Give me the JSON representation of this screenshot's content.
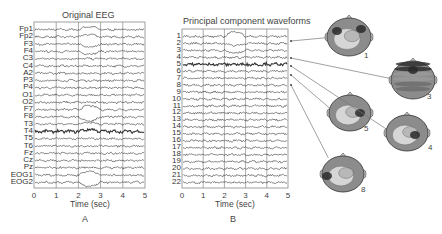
{
  "panel_a": {
    "title": "Original EEG",
    "channels": [
      "Fp1",
      "Fp2",
      "F3",
      "F4",
      "C3",
      "C4",
      "A2",
      "P3",
      "P4",
      "O1",
      "O2",
      "F7",
      "F8",
      "T3",
      "T4",
      "T5",
      "T6",
      "Fz",
      "Cz",
      "Pz",
      "EOG1",
      "EOG2"
    ],
    "xticks": [
      "0",
      "1",
      "2",
      "3",
      "4",
      "5"
    ],
    "xlabel": "Time (sec)",
    "label": "A"
  },
  "panel_b": {
    "title": "Principal component waveforms",
    "components": [
      "1",
      "2",
      "3",
      "4",
      "5",
      "6",
      "7",
      "8",
      "9",
      "10",
      "11",
      "12",
      "13",
      "14",
      "15",
      "16",
      "17",
      "18",
      "19",
      "20",
      "21",
      "22"
    ],
    "xticks": [
      "0",
      "1",
      "2",
      "3",
      "4",
      "5"
    ],
    "xlabel": "Time (sec)",
    "label": "B"
  },
  "scalp_maps": [
    {
      "label": "1",
      "component": 1
    },
    {
      "label": "3",
      "component": 3
    },
    {
      "label": "5",
      "component": 5
    },
    {
      "label": "4",
      "component": 4
    },
    {
      "label": "8",
      "component": 8
    }
  ],
  "colors": {
    "trace": "#333333",
    "grid": "#888888",
    "map_dark": "#2a2a2a",
    "map_mid": "#8c8c8c",
    "map_light": "#d6d6d6"
  },
  "chart_data": [
    {
      "type": "line",
      "title": "Original EEG",
      "xlabel": "Time (sec)",
      "ylabel": "",
      "xlim": [
        0,
        5
      ],
      "xticks": [
        0,
        1,
        2,
        3,
        4,
        5
      ],
      "grid": "vertical at each second",
      "series_names": [
        "Fp1",
        "Fp2",
        "F3",
        "F4",
        "C3",
        "C4",
        "A2",
        "P3",
        "P4",
        "O1",
        "O2",
        "F7",
        "F8",
        "T3",
        "T4",
        "T5",
        "T6",
        "Fz",
        "Cz",
        "Pz",
        "EOG1",
        "EOG2"
      ],
      "annotations": "Large eye-blink artifact between ~2 and ~3 s visible in frontal channels (Fp1, Fp2, F3, F4, F7, F8) and EOG1/EOG2"
    },
    {
      "type": "line",
      "title": "Principal component waveforms",
      "xlabel": "Time (sec)",
      "ylabel": "",
      "xlim": [
        0,
        5
      ],
      "xticks": [
        0,
        1,
        2,
        3,
        4,
        5
      ],
      "grid": "vertical at each second",
      "series_names": [
        "1",
        "2",
        "3",
        "4",
        "5",
        "6",
        "7",
        "8",
        "9",
        "10",
        "11",
        "12",
        "13",
        "14",
        "15",
        "16",
        "17",
        "18",
        "19",
        "20",
        "21",
        "22"
      ],
      "annotations": "Component 1 captures blink artifact (2-3 s); arrows link components 1,3,4,5,8 to scalp topography maps"
    }
  ]
}
